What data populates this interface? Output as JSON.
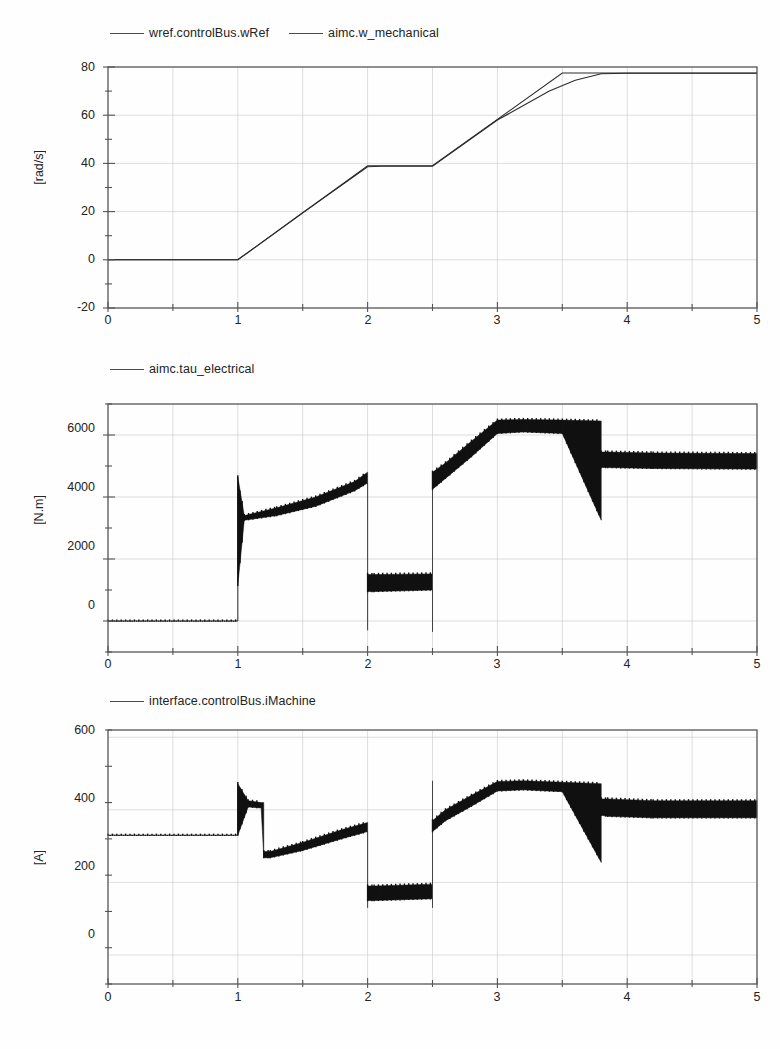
{
  "page": {
    "background_color": "#fefefe",
    "trace_color": "#2b2b2b",
    "grid_color": "#c8c8c8",
    "frame_color": "#555555"
  },
  "panels": [
    {
      "id": "speed",
      "legend": [
        {
          "label": "wref.controlBus.wRef",
          "icon": "line-swatch-icon"
        },
        {
          "label": "aimc.w_mechanical",
          "icon": "line-swatch-icon"
        }
      ],
      "ylabel": "[rad/s]",
      "yticks": [
        "80",
        "60",
        "40",
        "20",
        "0",
        "-20"
      ],
      "xticks": [
        "0",
        "1",
        "2",
        "3",
        "4",
        "5"
      ]
    },
    {
      "id": "torque",
      "legend": [
        {
          "label": "aimc.tau_electrical",
          "icon": "line-swatch-icon"
        }
      ],
      "ylabel": "[N.m]",
      "yticks": [
        "6000",
        "4000",
        "2000",
        "0"
      ],
      "xticks": [
        "0",
        "1",
        "2",
        "3",
        "4",
        "5"
      ]
    },
    {
      "id": "current",
      "legend": [
        {
          "label": "interface.controlBus.iMachine",
          "icon": "line-swatch-icon"
        }
      ],
      "ylabel": "[A]",
      "yticks": [
        "600",
        "400",
        "200",
        "0"
      ],
      "xticks": [
        "0",
        "1",
        "2",
        "3",
        "4",
        "5"
      ]
    }
  ],
  "chart_data": [
    {
      "type": "line",
      "title": "",
      "xlabel": "",
      "ylabel": "[rad/s]",
      "xlim": [
        0,
        5
      ],
      "ylim": [
        -20,
        80
      ],
      "xticks": [
        0,
        1,
        2,
        3,
        4,
        5
      ],
      "yticks": [
        -20,
        0,
        20,
        40,
        60,
        80
      ],
      "grid": true,
      "legend_position": "above-left",
      "series": [
        {
          "name": "wref.controlBus.wRef",
          "x": [
            0,
            1,
            2,
            2.5,
            3.5,
            5
          ],
          "values": [
            0,
            0,
            39,
            39,
            77.5,
            77.5
          ]
        },
        {
          "name": "aimc.w_mechanical",
          "x": [
            0,
            1,
            1.5,
            2,
            2.1,
            2.5,
            3,
            3.4,
            3.6,
            3.8,
            4,
            5
          ],
          "values": [
            0,
            0,
            19.5,
            38.6,
            38.8,
            38.8,
            58,
            70,
            74.5,
            77.2,
            77.4,
            77.4
          ]
        }
      ]
    },
    {
      "type": "line",
      "title": "",
      "xlabel": "",
      "ylabel": "[N.m]",
      "xlim": [
        0,
        5
      ],
      "ylim": [
        -1000,
        7000
      ],
      "xticks": [
        0,
        1,
        2,
        3,
        4,
        5
      ],
      "yticks": [
        0,
        2000,
        4000,
        6000
      ],
      "grid": true,
      "legend_position": "above-left",
      "series": [
        {
          "name": "aimc.tau_electrical",
          "description": "switching-ripple band; upper/lower envelope sampled",
          "x": [
            0,
            1.0,
            1.0,
            1.05,
            1.3,
            1.6,
            1.9,
            2.0,
            2.0,
            2.0,
            2.05,
            2.5,
            2.5,
            2.5,
            2.6,
            2.8,
            3.0,
            3.2,
            3.5,
            3.8,
            3.8,
            3.85,
            4.2,
            5.0
          ],
          "upper": [
            0,
            0,
            4650,
            3400,
            3650,
            4000,
            4500,
            4800,
            4800,
            1500,
            1500,
            1520,
            4800,
            4800,
            5100,
            5800,
            6480,
            6500,
            6480,
            6450,
            5450,
            5450,
            5420,
            5400
          ],
          "lower": [
            0,
            0,
            1150,
            3250,
            3400,
            3700,
            4200,
            4450,
            -300,
            950,
            950,
            1000,
            -350,
            4250,
            4600,
            5300,
            6050,
            6100,
            6050,
            3250,
            4950,
            4950,
            4920,
            4900
          ]
        }
      ]
    },
    {
      "type": "line",
      "title": "",
      "xlabel": "",
      "ylabel": "[A]",
      "xlim": [
        0,
        5
      ],
      "ylim": [
        -80,
        620
      ],
      "xticks": [
        0,
        1,
        2,
        3,
        4,
        5
      ],
      "yticks": [
        0,
        200,
        400,
        600
      ],
      "grid": true,
      "legend_position": "above-left",
      "series": [
        {
          "name": "interface.controlBus.iMachine",
          "description": "switching-ripple band; upper/lower envelope sampled",
          "x": [
            0,
            1.0,
            1.0,
            1.08,
            1.18,
            1.2,
            1.2,
            1.25,
            1.5,
            1.8,
            2.0,
            2.0,
            2.0,
            2.05,
            2.5,
            2.5,
            2.5,
            2.6,
            2.8,
            3.0,
            3.2,
            3.5,
            3.8,
            3.8,
            3.85,
            4.2,
            5.0
          ],
          "upper": [
            330,
            330,
            472,
            425,
            420,
            420,
            285,
            285,
            310,
            345,
            365,
            365,
            190,
            190,
            195,
            480,
            370,
            400,
            440,
            478,
            480,
            476,
            472,
            430,
            430,
            425,
            425
          ],
          "lower": [
            330,
            330,
            330,
            408,
            405,
            270,
            268,
            268,
            288,
            320,
            340,
            130,
            150,
            150,
            155,
            130,
            340,
            370,
            410,
            452,
            455,
            450,
            255,
            385,
            382,
            378,
            378
          ]
        }
      ]
    }
  ]
}
